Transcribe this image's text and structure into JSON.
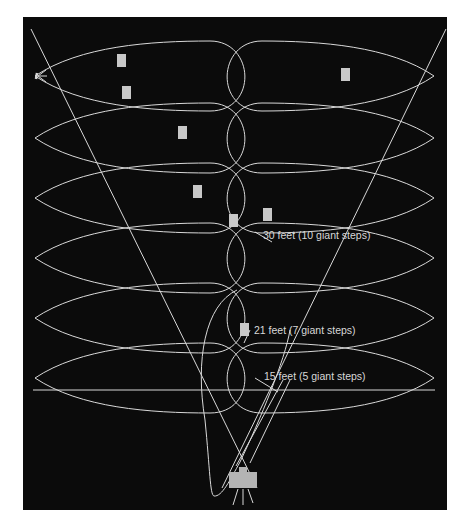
{
  "figure": {
    "background": "#0b0b0b",
    "line_color": "#d9d9d9",
    "marker_color": "#c8c8c8",
    "labels": [
      {
        "id": "label-30ft",
        "text": "30 feet (10 giant steps)",
        "x": 263,
        "y": 229
      },
      {
        "id": "label-21ft",
        "text": "21 feet (7 giant steps)",
        "x": 254,
        "y": 324
      },
      {
        "id": "label-15ft",
        "text": "15 feet (5 giant steps)",
        "x": 264,
        "y": 370
      }
    ],
    "rows_center_y": [
      76,
      138,
      198,
      258,
      318,
      378
    ],
    "markers": [
      {
        "x": 117,
        "y": 54
      },
      {
        "x": 122,
        "y": 86
      },
      {
        "x": 178,
        "y": 126
      },
      {
        "x": 193,
        "y": 185
      },
      {
        "x": 229,
        "y": 214
      },
      {
        "x": 263,
        "y": 208
      },
      {
        "x": 341,
        "y": 68
      },
      {
        "x": 240,
        "y": 323
      }
    ],
    "icons": [
      "light-source-icon",
      "camera-icon"
    ]
  }
}
